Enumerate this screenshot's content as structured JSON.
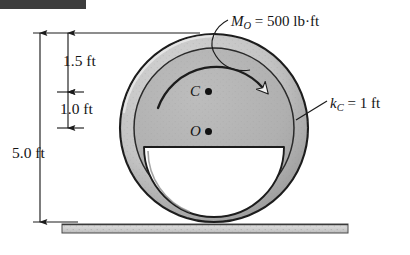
{
  "figure": {
    "background_color": "#ffffff"
  },
  "top_bar": {
    "name": "page-edge-bar",
    "color": "#3d3d3d"
  },
  "labels": {
    "moment": {
      "symbol": "M",
      "subscript": "O",
      "equals": " = ",
      "value": "500 lb·ft",
      "full": "M_O = 500 lb·ft"
    },
    "radius_of_gyration": {
      "symbol": "k",
      "subscript": "C",
      "equals": " = ",
      "value": "1 ft",
      "full": "k_C = 1 ft"
    },
    "point_c": "C",
    "point_o": "O"
  },
  "dimensions": {
    "top_segment": "1.5 ft",
    "middle_segment": "1.0 ft",
    "overall": "5.0 ft"
  },
  "geometry": {
    "wheel": {
      "center_x": 214,
      "center_y": 128,
      "outer_radius": 94,
      "rim_inner_radius": 79,
      "fill_color": "#b2b2b2",
      "rim_color": "#c9c9c9",
      "outline_color": "#1c1c1c"
    },
    "cutout": {
      "description": "semicircular void below point O, flat edge up",
      "center_x": 214,
      "flat_y": 147,
      "radius": 70,
      "fill_color": "#ffffff"
    },
    "mass_center_c": {
      "x": 208,
      "y": 92
    },
    "geometric_center_o": {
      "x": 208,
      "y": 132
    },
    "ground": {
      "y": 224,
      "x_start": 62,
      "x_end": 348,
      "thickness": 9,
      "fill_color": "#d5d5d5"
    },
    "moment_arrow": {
      "direction": "clockwise",
      "radius": 62
    }
  },
  "colors": {
    "ink": "#141414",
    "wheel_fill": "#b2b2b2",
    "wheel_rim": "#c9c9c9",
    "ground_fill": "#d5d5d5"
  }
}
